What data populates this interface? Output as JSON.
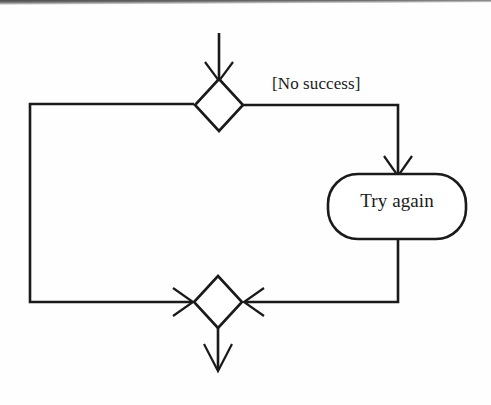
{
  "diagram": {
    "type": "uml-activity-diagram",
    "background_color": "#fefefe",
    "stroke_color": "#1a1a1a",
    "nodes": [
      {
        "id": "merge",
        "kind": "merge-node",
        "shape": "diamond",
        "label": "",
        "center_x": 219,
        "center_y": 105,
        "half_width": 24,
        "half_height": 26
      },
      {
        "id": "try-again",
        "kind": "action-node",
        "shape": "rounded-rectangle",
        "label": "Try again",
        "x": 328,
        "y": 174,
        "width": 138,
        "height": 65,
        "corner_radius": 30
      },
      {
        "id": "decision",
        "kind": "decision-node",
        "shape": "diamond",
        "label": "",
        "center_x": 218,
        "center_y": 302,
        "half_width": 24,
        "half_height": 26
      }
    ],
    "edges": [
      {
        "id": "edge-in",
        "from": "external-in",
        "to": "merge",
        "guard": "",
        "arrowhead": "open-v",
        "direction": "down"
      },
      {
        "id": "edge-no-success",
        "from": "merge",
        "to": "try-again",
        "guard": "[No success]",
        "arrowhead": "open-v",
        "direction": "right-then-down"
      },
      {
        "id": "edge-retry-back",
        "from": "try-again",
        "to": "decision",
        "guard": "",
        "arrowhead": "open-v",
        "direction": "down-then-left"
      },
      {
        "id": "edge-loop-back",
        "from": "decision",
        "to": "merge",
        "guard": "",
        "arrowhead": "open-v",
        "direction": "left-then-up-then-right"
      },
      {
        "id": "edge-out",
        "from": "decision",
        "to": "external-out",
        "guard": "",
        "arrowhead": "open-v",
        "direction": "down"
      }
    ],
    "labels": {
      "guard_no_success": "[No success]",
      "action_try_again": "Try again"
    }
  }
}
